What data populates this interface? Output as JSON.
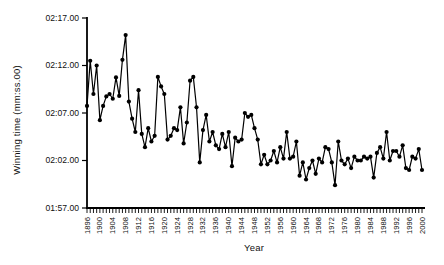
{
  "chart_data": {
    "type": "line",
    "title": "",
    "xlabel": "Year",
    "ylabel": "Winning time (mm:ss.00)",
    "legend": "none",
    "grid": false,
    "marker": "filled-circle",
    "line_color": "#000000",
    "marker_color": "#000000",
    "axis_color": "#000000",
    "background": "#ffffff",
    "xlim": [
      1896,
      2000
    ],
    "ylim_seconds": [
      117,
      137
    ],
    "yticks": [
      {
        "label": "02:17.00",
        "seconds": 137
      },
      {
        "label": "02:12.00",
        "seconds": 132
      },
      {
        "label": "02:07.00",
        "seconds": 127
      },
      {
        "label": "02:02.00",
        "seconds": 122
      },
      {
        "label": "01:57.00",
        "seconds": 117
      }
    ],
    "xtick_labels": [
      "1896",
      "1900",
      "1904",
      "1908",
      "1912",
      "1916",
      "1920",
      "1924",
      "1928",
      "1932",
      "1936",
      "1940",
      "1944",
      "1948",
      "1952",
      "1956",
      "1960",
      "1964",
      "1968",
      "1972",
      "1976",
      "1980",
      "1984",
      "1988",
      "1992",
      "1996",
      "2000"
    ],
    "minor_tick_every_years": 1,
    "x": [
      1896,
      1897,
      1898,
      1899,
      1900,
      1901,
      1902,
      1903,
      1904,
      1905,
      1906,
      1907,
      1908,
      1909,
      1910,
      1911,
      1912,
      1913,
      1914,
      1915,
      1916,
      1917,
      1918,
      1919,
      1920,
      1921,
      1922,
      1923,
      1924,
      1925,
      1926,
      1927,
      1928,
      1929,
      1930,
      1931,
      1932,
      1933,
      1934,
      1935,
      1936,
      1937,
      1938,
      1939,
      1940,
      1941,
      1942,
      1943,
      1944,
      1945,
      1946,
      1947,
      1948,
      1949,
      1950,
      1951,
      1952,
      1953,
      1954,
      1955,
      1956,
      1957,
      1958,
      1959,
      1960,
      1961,
      1962,
      1963,
      1964,
      1965,
      1966,
      1967,
      1968,
      1969,
      1970,
      1971,
      1972,
      1973,
      1974,
      1975,
      1976,
      1977,
      1978,
      1979,
      1980,
      1981,
      1982,
      1983,
      1984,
      1985,
      1986,
      1987,
      1988,
      1989,
      1990,
      1991,
      1992,
      1993,
      1994,
      1995,
      1996,
      1997,
      1998,
      1999,
      2000
    ],
    "values_seconds": [
      127.75,
      132.5,
      129.0,
      132.0,
      126.25,
      127.75,
      128.75,
      129.0,
      128.5,
      130.75,
      128.8,
      132.6,
      135.2,
      128.2,
      126.4,
      125.0,
      129.4,
      124.8,
      123.4,
      125.4,
      124.0,
      124.6,
      130.8,
      129.8,
      129.0,
      124.2,
      124.6,
      125.4,
      125.2,
      127.6,
      123.8,
      126.0,
      130.4,
      130.8,
      127.6,
      121.8,
      125.2,
      126.8,
      124.0,
      125.0,
      123.6,
      123.2,
      124.8,
      123.4,
      125.0,
      121.4,
      124.4,
      124.0,
      124.2,
      127.0,
      126.6,
      126.8,
      125.4,
      124.2,
      121.6,
      122.6,
      121.6,
      122.0,
      123.0,
      121.8,
      123.4,
      122.2,
      125.0,
      122.2,
      122.4,
      124.0,
      120.4,
      121.8,
      120.0,
      121.2,
      122.0,
      120.6,
      122.2,
      121.8,
      123.4,
      123.2,
      121.8,
      119.4,
      124.0,
      122.0,
      121.6,
      122.2,
      121.2,
      122.4,
      122.0,
      122.0,
      122.4,
      122.2,
      122.4,
      120.2,
      122.8,
      123.4,
      122.2,
      125.0,
      122.0,
      123.0,
      123.0,
      122.4,
      123.6,
      121.2,
      121.0,
      122.4,
      122.2,
      123.2,
      121.0
    ]
  }
}
